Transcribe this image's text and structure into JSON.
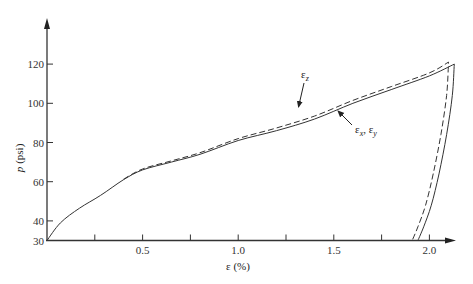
{
  "chart_data": {
    "type": "line",
    "title": "",
    "xlabel": "ε (%)",
    "ylabel": "p (psi)",
    "xlim": [
      0,
      2.12
    ],
    "ylim": [
      30,
      130
    ],
    "x_ticks": [
      {
        "value": 0.25,
        "label": ""
      },
      {
        "value": 0.5,
        "label": "0.5"
      },
      {
        "value": 0.75,
        "label": ""
      },
      {
        "value": 1.0,
        "label": "1.0"
      },
      {
        "value": 1.25,
        "label": ""
      },
      {
        "value": 1.5,
        "label": "1.5"
      },
      {
        "value": 1.75,
        "label": ""
      },
      {
        "value": 2.0,
        "label": "2.0"
      }
    ],
    "y_ticks": [
      {
        "value": 30,
        "label": "30"
      },
      {
        "value": 40,
        "label": "40"
      },
      {
        "value": 60,
        "label": "60"
      },
      {
        "value": 80,
        "label": "80"
      },
      {
        "value": 100,
        "label": "100"
      },
      {
        "value": 120,
        "label": "120"
      }
    ],
    "grid": false,
    "series": [
      {
        "name": "εx, εy",
        "style": "solid",
        "x": [
          0,
          0.07,
          0.17,
          0.28,
          0.4,
          0.5,
          0.65,
          0.8,
          1.0,
          1.2,
          1.4,
          1.6,
          1.8,
          2.0,
          2.13,
          2.12,
          2.09,
          2.05,
          2.01,
          1.97,
          1.94
        ],
        "y": [
          30,
          39,
          46.5,
          53,
          61,
          66,
          70,
          74,
          81,
          86,
          92,
          100,
          107,
          114,
          120,
          104,
          84,
          64,
          48,
          37,
          30
        ]
      },
      {
        "name": "εz",
        "style": "dashed",
        "x": [
          0.4,
          0.5,
          0.65,
          0.8,
          1.0,
          1.2,
          1.4,
          1.6,
          1.8,
          2.0,
          2.1,
          2.09,
          2.06,
          2.02,
          1.98,
          1.94,
          1.91
        ],
        "y": [
          61.3,
          66.5,
          70.6,
          74.8,
          82,
          87.4,
          93.5,
          101.5,
          108.5,
          115.5,
          121,
          104,
          84,
          64,
          48,
          37,
          30
        ]
      }
    ],
    "annotations": [
      {
        "text": "εz",
        "x": 1.36,
        "y": 112,
        "arrow_to": [
          1.31,
          89
        ]
      },
      {
        "text": "εx, εy",
        "x": 1.62,
        "y": 84,
        "arrow_to": [
          1.51,
          95.5
        ]
      }
    ]
  },
  "labels": {
    "ylabel_p": "p",
    "ylabel_unit": "(psi)",
    "xlabel": "ε (%)",
    "ann_z_base": "ε",
    "ann_z_sub": "z",
    "ann_xy_base1": "ε",
    "ann_xy_sub1": "x",
    "ann_xy_sep": ", ",
    "ann_xy_base2": "ε",
    "ann_xy_sub2": "y"
  }
}
